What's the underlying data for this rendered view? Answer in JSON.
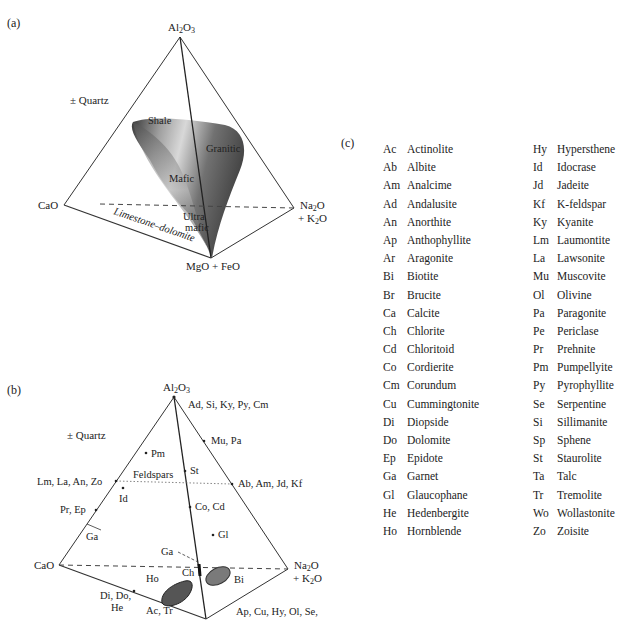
{
  "panels": {
    "a": {
      "label": "(a)",
      "vertices": {
        "top": "Al2O3",
        "left": "CaO",
        "right_line1": "Na2O",
        "right_line2": "+ K2O",
        "bottom": "MgO + FeO"
      },
      "quartz": "± Quartz",
      "regions": [
        "Shale",
        "Granitic",
        "Mafic",
        "Ultra",
        "mafic",
        "Limestone–dolomite"
      ]
    },
    "b": {
      "label": "(b)",
      "vertices": {
        "top": "Al2O3",
        "left": "CaO",
        "right_line1": "Na2O",
        "right_line2": "+ K2O"
      },
      "quartz": "± Quartz",
      "points": {
        "top_right": "Ad, Si, Ky, Py, Cm",
        "mu_pa": "Mu, Pa",
        "pm": "Pm",
        "st": "St",
        "feldspars": "Feldspars",
        "lm_la": "Lm, La, An, Zo",
        "ab_am": "Ab, Am, Jd, Kf",
        "id": "Id",
        "pr_ep": "Pr, Ep",
        "co_cd": "Co, Cd",
        "ga_left": "Ga",
        "gl": "Gl",
        "ga_center": "Ga",
        "ch": "Ch",
        "ho": "Ho",
        "bi": "Bi",
        "di_do_1": "Di, Do,",
        "di_do_2": "He",
        "ac_tr": "Ac, Tr",
        "ap_cu": "Ap, Cu, Hy, Ol, Se,"
      }
    },
    "c": {
      "label": "(c)",
      "left_column": [
        {
          "abbr": "Ac",
          "name": "Actinolite"
        },
        {
          "abbr": "Ab",
          "name": "Albite"
        },
        {
          "abbr": "Am",
          "name": "Analcime"
        },
        {
          "abbr": "Ad",
          "name": "Andalusite"
        },
        {
          "abbr": "An",
          "name": "Anorthite"
        },
        {
          "abbr": "Ap",
          "name": "Anthophyllite"
        },
        {
          "abbr": "Ar",
          "name": "Aragonite"
        },
        {
          "abbr": "Bi",
          "name": "Biotite"
        },
        {
          "abbr": "Br",
          "name": "Brucite"
        },
        {
          "abbr": "Ca",
          "name": "Calcite"
        },
        {
          "abbr": "Ch",
          "name": "Chlorite"
        },
        {
          "abbr": "Cd",
          "name": "Chloritoid"
        },
        {
          "abbr": "Co",
          "name": "Cordierite"
        },
        {
          "abbr": "Cm",
          "name": "Corundum"
        },
        {
          "abbr": "Cu",
          "name": "Cummingtonite"
        },
        {
          "abbr": "Di",
          "name": "Diopside"
        },
        {
          "abbr": "Do",
          "name": "Dolomite"
        },
        {
          "abbr": "Ep",
          "name": "Epidote"
        },
        {
          "abbr": "Ga",
          "name": "Garnet"
        },
        {
          "abbr": "Gl",
          "name": "Glaucophane"
        },
        {
          "abbr": "He",
          "name": "Hedenbergite"
        },
        {
          "abbr": "Ho",
          "name": "Hornblende"
        }
      ],
      "right_column": [
        {
          "abbr": "Hy",
          "name": "Hypersthene"
        },
        {
          "abbr": "Id",
          "name": "Idocrase"
        },
        {
          "abbr": "Jd",
          "name": "Jadeite"
        },
        {
          "abbr": "Kf",
          "name": "K-feldspar"
        },
        {
          "abbr": "Ky",
          "name": "Kyanite"
        },
        {
          "abbr": "Lm",
          "name": "Laumontite"
        },
        {
          "abbr": "La",
          "name": "Lawsonite"
        },
        {
          "abbr": "Mu",
          "name": "Muscovite"
        },
        {
          "abbr": "Ol",
          "name": "Olivine"
        },
        {
          "abbr": "Pa",
          "name": "Paragonite"
        },
        {
          "abbr": "Pe",
          "name": "Periclase"
        },
        {
          "abbr": "Pr",
          "name": "Prehnite"
        },
        {
          "abbr": "Pm",
          "name": "Pumpellyite"
        },
        {
          "abbr": "Py",
          "name": "Pyrophyllite"
        },
        {
          "abbr": "Se",
          "name": "Serpentine"
        },
        {
          "abbr": "Si",
          "name": "Sillimanite"
        },
        {
          "abbr": "Sp",
          "name": "Sphene"
        },
        {
          "abbr": "St",
          "name": "Staurolite"
        },
        {
          "abbr": "Ta",
          "name": "Talc"
        },
        {
          "abbr": "Tr",
          "name": "Tremolite"
        },
        {
          "abbr": "Wo",
          "name": "Wollastonite"
        },
        {
          "abbr": "Zo",
          "name": "Zoisite"
        }
      ]
    }
  },
  "colors": {
    "line": "#333333",
    "surface_dark": "#3a3a3a",
    "surface_light": "#d8d8d8",
    "blob": "#7a7a7a"
  }
}
